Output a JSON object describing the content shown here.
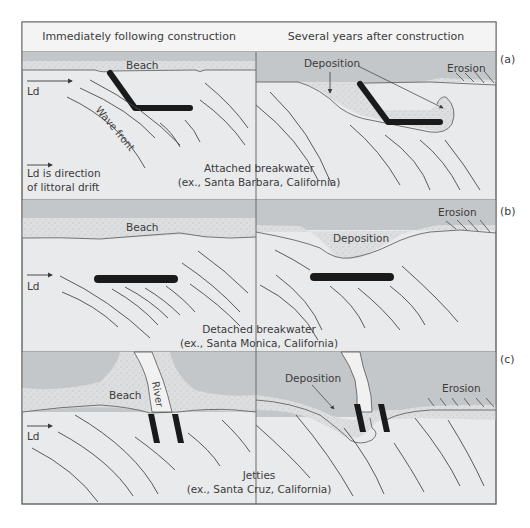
{
  "header": {
    "left_column": "Immediately following construction",
    "right_column": "Several years after construction"
  },
  "panels": [
    {
      "id": "a",
      "tag": "(a)",
      "caption_line1": "Attached breakwater",
      "caption_line2": "(ex., Santa Barbara, California)",
      "left": {
        "beach": "Beach",
        "drift": "Ld",
        "wave_front": "Wave front",
        "legend_line1": "Ld is direction",
        "legend_line2": "of littoral drift"
      },
      "right": {
        "deposition": "Deposition",
        "erosion": "Erosion"
      }
    },
    {
      "id": "b",
      "tag": "(b)",
      "caption_line1": "Detached breakwater",
      "caption_line2": "(ex., Santa Monica, California)",
      "left": {
        "beach": "Beach",
        "drift": "Ld"
      },
      "right": {
        "deposition": "Deposition",
        "erosion": "Erosion"
      }
    },
    {
      "id": "c",
      "tag": "(c)",
      "caption_line1": "Jetties",
      "caption_line2": "(ex., Santa Cruz, California)",
      "left": {
        "beach": "Beach",
        "river": "River",
        "drift": "Ld"
      },
      "right": {
        "deposition": "Deposition",
        "erosion": "Erosion"
      }
    }
  ],
  "colors": {
    "land": "#c4c7c9",
    "beach": "#dcdedf",
    "water": "#e9eaeb",
    "structure": "#1a1a1a",
    "line": "#4a4a4a"
  }
}
